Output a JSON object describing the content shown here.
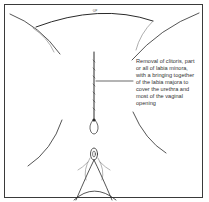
{
  "diagram": {
    "type": "medical-illustration",
    "annotation": {
      "lines": [
        "Removal of clitoris, part",
        "or all of labia minora,",
        "with a bringing together",
        "of the labia majora to",
        "cover the urethra and",
        "most of the vaginal",
        "opening"
      ]
    },
    "top_mark": "·UP",
    "colors": {
      "line": "#2a2a2a",
      "border": "#3a3a3a",
      "background": "#ffffff",
      "text": "#333333"
    }
  }
}
